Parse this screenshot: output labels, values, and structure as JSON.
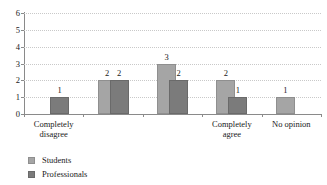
{
  "chart_data": {
    "type": "bar",
    "title": "",
    "subtitle": "",
    "xlabel": "",
    "ylabel": "",
    "ylim": [
      0,
      6
    ],
    "yticks": [
      "0",
      "1",
      "2",
      "3",
      "4",
      "5",
      "6"
    ],
    "grid": "horizontal-dotted",
    "legend_position": "bottom-left",
    "categories": [
      "Completely\ndisagree",
      "",
      "",
      "Completely\nagree",
      "No opinion"
    ],
    "series": [
      {
        "name": "Students",
        "color": "#a5a5a5",
        "values": [
          null,
          2,
          3,
          2,
          1
        ]
      },
      {
        "name": "Professionals",
        "color": "#7b7b7b",
        "values": [
          1,
          2,
          2,
          1,
          null
        ]
      }
    ],
    "data_labels": [
      {
        "group": 0,
        "series": "Professionals",
        "text": "1"
      },
      {
        "group": 1,
        "series": "Students",
        "text": "2"
      },
      {
        "group": 1,
        "series": "Professionals",
        "text": "2"
      },
      {
        "group": 2,
        "series": "Students",
        "text": "3"
      },
      {
        "group": 2,
        "series": "Professionals",
        "text": "2"
      },
      {
        "group": 3,
        "series": "Students",
        "text": "2"
      },
      {
        "group": 3,
        "series": "Professionals",
        "text": "1"
      },
      {
        "group": 4,
        "series": "Students",
        "text": "1"
      }
    ]
  },
  "axis": {
    "y_ticks": [
      {
        "label": "6",
        "value": 6
      },
      {
        "label": "5",
        "value": 5
      },
      {
        "label": "4",
        "value": 4
      },
      {
        "label": "3",
        "value": 3
      },
      {
        "label": "2",
        "value": 2
      },
      {
        "label": "1",
        "value": 1
      },
      {
        "label": "0",
        "value": 0
      }
    ]
  },
  "category_labels": [
    {
      "line1": "Completely",
      "line2": "disagree"
    },
    {
      "line1": "",
      "line2": ""
    },
    {
      "line1": "",
      "line2": ""
    },
    {
      "line1": "Completely",
      "line2": "agree"
    },
    {
      "line1": "No opinion",
      "line2": ""
    }
  ],
  "legend": {
    "items": [
      {
        "label": "Students",
        "color": "#a5a5a5"
      },
      {
        "label": "Professionals",
        "color": "#7b7b7b"
      }
    ]
  }
}
